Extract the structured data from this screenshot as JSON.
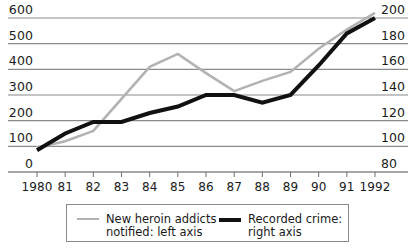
{
  "chart_data": {
    "type": "line",
    "title": "",
    "subtitle": "",
    "xlabel": "",
    "ylabel": "",
    "grid": true,
    "legend_position": "bottom",
    "x": [
      1980,
      1981,
      1982,
      1983,
      1984,
      1985,
      1986,
      1987,
      1988,
      1989,
      1990,
      1991,
      1992
    ],
    "categories": [
      "1980",
      "81",
      "82",
      "83",
      "84",
      "85",
      "86",
      "87",
      "88",
      "89",
      "90",
      "91",
      "1992"
    ],
    "axes": {
      "left": {
        "label": "New heroin addicts notified",
        "ticks": [
          600,
          500,
          400,
          300,
          200,
          100,
          0
        ],
        "tick_labels": [
          "600",
          "500",
          "400",
          "300",
          "200",
          "100",
          "0"
        ],
        "ylim": [
          0,
          600
        ]
      },
      "right": {
        "label": "Recorded crime",
        "ticks": [
          200,
          180,
          160,
          140,
          120,
          100,
          80
        ],
        "tick_labels": [
          "200",
          "180",
          "160",
          "140",
          "120",
          "100",
          "80"
        ],
        "ylim": [
          80,
          200
        ]
      }
    },
    "series": [
      {
        "name": "New heroin addicts notified: left axis",
        "legend_label": "New heroin addicts\nnotified: left axis",
        "axis": "left",
        "color": "#b3b3b3",
        "line_width": 2.6,
        "values": [
          95,
          120,
          160,
          285,
          410,
          460,
          385,
          315,
          355,
          390,
          480,
          555,
          620
        ]
      },
      {
        "name": "Recorded crime: right axis",
        "legend_label": "Recorded crime:\nright axis",
        "axis": "right",
        "color": "#111111",
        "line_width": 4.0,
        "values": [
          97,
          110,
          119,
          119,
          126,
          131,
          140,
          140,
          134,
          140,
          163,
          188,
          200
        ]
      }
    ]
  },
  "colors": {
    "grid": "#8a8a8a",
    "axis": "#6f6f6f",
    "series_gray": "#b3b3b3",
    "series_black": "#111111",
    "text": "#1a1a1a",
    "legend_border": "#8a8a8a",
    "background": "#ffffff"
  },
  "legend": {
    "entries": [
      {
        "label": "New heroin addicts\nnotified: left axis",
        "swatch": "gray-line-swatch"
      },
      {
        "label": "Recorded crime:\nright axis",
        "swatch": "black-line-swatch"
      }
    ]
  }
}
